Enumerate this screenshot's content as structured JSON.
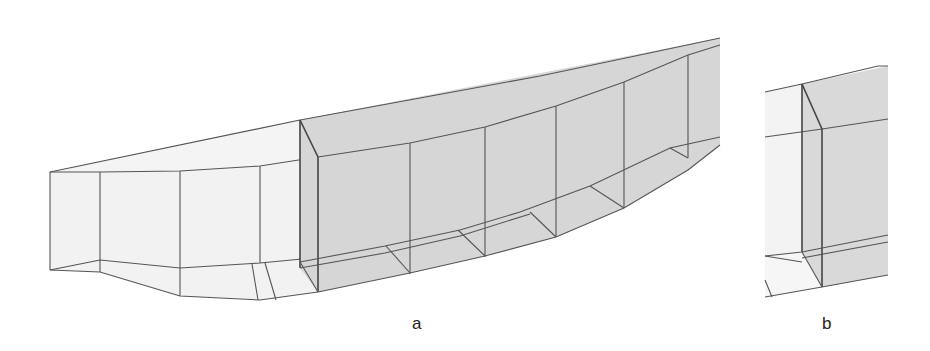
{
  "figure": {
    "panels": [
      {
        "id": "a",
        "label": "a",
        "description": "Wireframe of hull segment with shaded block region"
      },
      {
        "id": "b",
        "label": "b",
        "description": "Close-up of block joint detail"
      }
    ],
    "colors": {
      "light_fill": "#f1f1f1",
      "shaded_fill": "#d9d9d9",
      "edge": "#555555",
      "background": "#ffffff"
    }
  }
}
